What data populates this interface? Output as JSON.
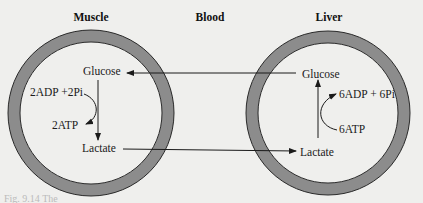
{
  "headers": {
    "muscle": "Muscle",
    "blood": "Blood",
    "liver": "Liver"
  },
  "muscle": {
    "glucose": "Glucose",
    "lactate": "Lactate",
    "input": "2ADP +2Pi",
    "output": "2ATP"
  },
  "liver": {
    "glucose": "Glucose",
    "lactate": "Lactate",
    "output": "6ADP + 6Pi",
    "input": "6ATP"
  },
  "caption": "Fig. 9.14  The",
  "colors": {
    "ring": "#8c8c8c",
    "ring_edge": "#2a2a2a",
    "background": "#efefed",
    "ink": "#1a1a1a"
  }
}
